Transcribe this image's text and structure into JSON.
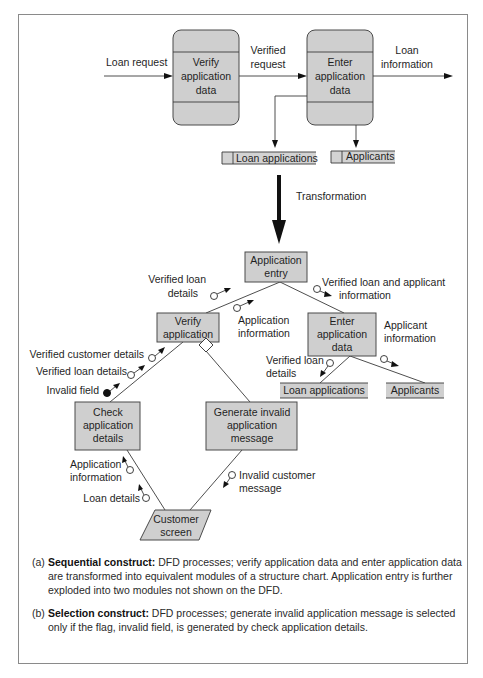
{
  "dfd": {
    "inputs": {
      "loan_request": "Loan request"
    },
    "processes": [
      {
        "id": "verify",
        "lines": [
          "Verify",
          "application",
          "data"
        ]
      },
      {
        "id": "enter",
        "lines": [
          "Enter",
          "application",
          "data"
        ]
      }
    ],
    "flows": {
      "verified_request": [
        "Verified",
        "request"
      ],
      "loan_information": [
        "Loan",
        "information"
      ]
    },
    "stores": [
      {
        "id": "loan_applications",
        "label": "Loan applications"
      },
      {
        "id": "applicants",
        "label": "Applicants"
      }
    ]
  },
  "transformation": {
    "label": "Transformation"
  },
  "structure_chart": {
    "modules": {
      "application_entry": [
        "Application",
        "entry"
      ],
      "verify_application": [
        "Verify",
        "application"
      ],
      "enter_application_data": [
        "Enter",
        "application",
        "data"
      ],
      "check_application_details": [
        "Check",
        "application",
        "details"
      ],
      "generate_invalid_message": [
        "Generate invalid",
        "application",
        "message"
      ],
      "customer_screen": [
        "Customer",
        "screen"
      ],
      "loan_applications": "Loan applications",
      "applicants": "Applicants"
    },
    "couples": {
      "verified_loan_details_top": [
        "Verified loan",
        "details"
      ],
      "application_information_top": [
        "Application",
        "information"
      ],
      "verified_loan_and_applicant": [
        "Verified loan and applicant",
        "information"
      ],
      "applicant_information": [
        "Applicant",
        "information"
      ],
      "verified_loan_details_right": [
        "Verified loan",
        "details"
      ],
      "verified_customer_details": "Verified customer details",
      "verified_loan_details_left": "Verified loan details",
      "invalid_field": "Invalid field",
      "application_information_bottom": [
        "Application",
        "information"
      ],
      "loan_details": "Loan details",
      "invalid_customer_message": [
        "Invalid customer",
        "message"
      ]
    }
  },
  "captions": [
    {
      "label": "(a)",
      "title": "Sequential construct:",
      "text": " DFD processes; verify application data and enter application data are transformed into equivalent modules of a structure chart. Application entry is further exploded into two modules not shown on the DFD."
    },
    {
      "label": "(b)",
      "title": "Selection construct:",
      "text": " DFD processes; generate invalid application message is selected only if the flag, invalid field, is generated by check application details."
    }
  ]
}
